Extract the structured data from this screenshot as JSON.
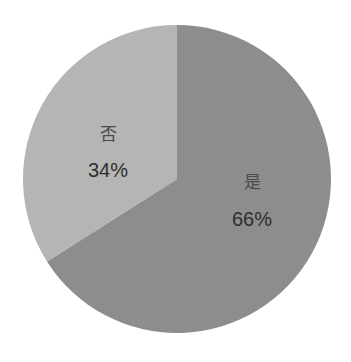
{
  "chart_data": {
    "type": "pie",
    "title": "",
    "categories": [
      "是",
      "否"
    ],
    "values": [
      66,
      34
    ],
    "labels": [
      "66%",
      "34%"
    ],
    "colors": [
      "#8d8d8d",
      "#b5b5b5"
    ],
    "start_angle": "12 o'clock, slices drawn: 是 clockwise, 否 counter-clockwise",
    "legend": "none (labels inside slices)"
  },
  "slices": [
    {
      "name": "是",
      "percent_label": "66%"
    },
    {
      "name": "否",
      "percent_label": "34%"
    }
  ]
}
